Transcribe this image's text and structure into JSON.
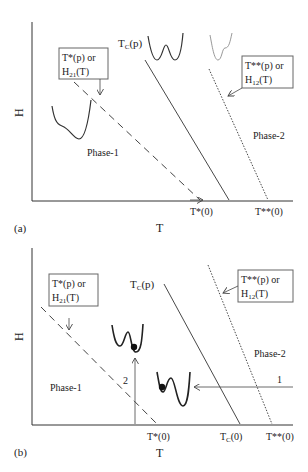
{
  "panel_a": {
    "tag": "(a)",
    "x_axis_label": "T",
    "y_axis_label": "H",
    "box_left": {
      "line1": "T*(p) or",
      "line2_main": "H",
      "line2_sub": "21",
      "line2_tail": "(T)"
    },
    "box_right": {
      "line1": "T**(p) or",
      "line2_main": "H",
      "line2_sub": "12",
      "line2_tail": "(T)"
    },
    "tc_label_main": "T",
    "tc_label_sub": "C",
    "tc_label_tail": "(p)",
    "phase1": "Phase-1",
    "phase2": "Phase-2",
    "tick_tstar": "T*(0)",
    "tick_tstarstar": "T**(0)"
  },
  "panel_b": {
    "tag": "(b)",
    "x_axis_label": "T",
    "y_axis_label": "H",
    "box_left": {
      "line1": "T*(p) or",
      "line2_main": "H",
      "line2_sub": "21",
      "line2_tail": "(T)"
    },
    "box_right": {
      "line1": "T**(p) or",
      "line2_main": "H",
      "line2_sub": "12",
      "line2_tail": "(T)"
    },
    "tc_label_main": "T",
    "tc_label_sub": "C",
    "tc_label_tail": "(p)",
    "phase1": "Phase-1",
    "phase2": "Phase-2",
    "path1_label": "1",
    "path2_label": "2",
    "tick_tstar": "T*(0)",
    "tick_tc_main": "T",
    "tick_tc_sub": "C",
    "tick_tc_tail": "(0)",
    "tick_tstarstar": "T**(0)"
  }
}
